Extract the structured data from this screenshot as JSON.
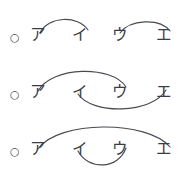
{
  "figure": {
    "background_color": "#ffffff",
    "ink_color": "#3c3c44",
    "arc_color": "#4a4a52",
    "width": 184,
    "height": 175
  },
  "rows": [
    {
      "id": "row-1",
      "bullet": "○",
      "kana": [
        "ア",
        "イ",
        "ウ",
        "エ"
      ],
      "arcs_above": [
        "ア–イ",
        "ウ–エ"
      ],
      "arcs_below": []
    },
    {
      "id": "row-2",
      "bullet": "○",
      "kana": [
        "ア",
        "イ",
        "ウ",
        "エ"
      ],
      "arcs_above": [
        "ア–ウ"
      ],
      "arcs_below": [
        "イ–エ"
      ]
    },
    {
      "id": "row-3",
      "bullet": "○",
      "kana": [
        "ア",
        "イ",
        "ウ",
        "エ"
      ],
      "arcs_above": [
        "ア–エ"
      ],
      "arcs_below": [
        "イ–ウ"
      ]
    }
  ],
  "geometry": {
    "bullet_x": 10,
    "kana_x": [
      30,
      72,
      112,
      156
    ],
    "baseline_y": 40,
    "row_tops": [
      0,
      57,
      114
    ]
  },
  "arc_paths": {
    "row1_a_i": "M 40 33 C 48 16, 78 15, 88 30",
    "row1_u_e": "M 120 33 C 130 19, 160 18, 170 31",
    "row2_a_u": "M 38 34 C 52 9, 112 8, 126 30",
    "row2_i_e": "M 78 37 C 92 58, 152 57, 166 33",
    "row3_a_e": "M 38 35 C 58 6, 148 6, 170 33",
    "row3_i_u": "M 78 37 C 88 56, 118 56, 126 34"
  }
}
